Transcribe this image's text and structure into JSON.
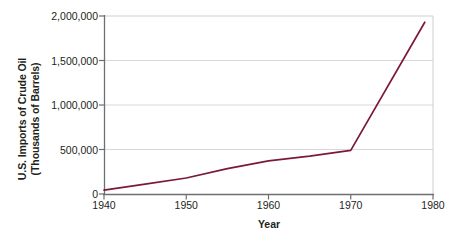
{
  "chart_data": {
    "type": "line",
    "title": "",
    "xlabel": "Year",
    "ylabel": "U.S. Imports of Crude Oil (Thousands of Barrels)",
    "ylabel_lines": [
      "U.S. Imports of Crude Oil",
      "(Thousands of Barrels)"
    ],
    "xlim": [
      1940,
      1980
    ],
    "ylim": [
      0,
      2000000
    ],
    "xticks": [
      1940,
      1950,
      1960,
      1970,
      1980
    ],
    "xtick_labels": [
      "1940",
      "1950",
      "1960",
      "1970",
      "1980"
    ],
    "yticks": [
      0,
      500000,
      1000000,
      1500000,
      2000000
    ],
    "ytick_labels": [
      "0",
      "500,000",
      "1,000,000",
      "1,500,000",
      "2,000,000"
    ],
    "grid": "horizontal",
    "legend": "none",
    "series": [
      {
        "name": "U.S. Imports of Crude Oil",
        "color": "#7a1a35",
        "x": [
          1940,
          1945,
          1950,
          1955,
          1960,
          1965,
          1970,
          1979
        ],
        "values": [
          43000,
          110000,
          180000,
          285000,
          372000,
          425000,
          490000,
          1930000
        ]
      }
    ]
  },
  "axes": {
    "x_title": "Year",
    "y_title_line1": "U.S. Imports of Crude Oil",
    "y_title_line2": "(Thousands of Barrels)"
  },
  "colors": {
    "line": "#7a1a35",
    "grid": "#d8d8d8",
    "axis": "#6f6f6f",
    "text": "#231f20",
    "background": "#ffffff"
  }
}
